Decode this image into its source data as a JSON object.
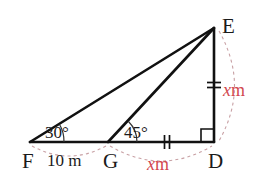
{
  "figure": {
    "background_color": "#ffffff",
    "stroke_color": "#111111",
    "accent_color": "#d2484f",
    "arc_color": "#c8a0a4",
    "width": 271,
    "height": 187
  },
  "vertices": {
    "E": {
      "label": "E",
      "x": 214,
      "y": 28,
      "label_x": 222,
      "label_y": 28
    },
    "F": {
      "label": "F",
      "x": 30,
      "y": 142,
      "label_x": 22,
      "label_y": 163
    },
    "G": {
      "label": "G",
      "x": 108,
      "y": 142,
      "label_x": 103,
      "label_y": 163
    },
    "D": {
      "label": "D",
      "x": 214,
      "y": 142,
      "label_x": 208,
      "label_y": 163
    }
  },
  "angles": [
    {
      "at": "F",
      "value": "30",
      "degree_symbol": "°",
      "label": "30°",
      "label_x": 45,
      "label_y": 134
    },
    {
      "at": "G",
      "value": "45",
      "degree_symbol": "°",
      "label": "45°",
      "label_x": 124,
      "label_y": 134
    },
    {
      "at": "D",
      "value": "90",
      "label": "right-angle",
      "marked": "square"
    }
  ],
  "segments": [
    {
      "name": "FE",
      "from": "F",
      "to": "E",
      "style": "solid"
    },
    {
      "name": "FD",
      "from": "F",
      "to": "D",
      "style": "solid"
    },
    {
      "name": "GE",
      "from": "G",
      "to": "E",
      "style": "solid"
    },
    {
      "name": "ED",
      "from": "E",
      "to": "D",
      "style": "solid"
    }
  ],
  "measures": [
    {
      "name": "FG",
      "text": "10 m",
      "value": "10",
      "unit": "m",
      "color": "#1a1a1a",
      "label_x": 47,
      "label_y": 162,
      "italic": false
    },
    {
      "name": "GD",
      "text_var": "x",
      "text_unit": "m",
      "text": "x m",
      "color": "#d2484f",
      "label_x": 147,
      "label_y": 166,
      "italic": true,
      "tick": "double-vertical"
    },
    {
      "name": "ED",
      "text_var": "x",
      "text_unit": "m",
      "text": "x m",
      "color": "#d2484f",
      "label_x": 223,
      "label_y": 92,
      "italic": true,
      "tick": "double-horizontal"
    }
  ],
  "tick_marks": [
    {
      "name": "gd-equal-tick",
      "on": "GD",
      "x": 167,
      "y": 142,
      "orientation": "vertical",
      "count": 2
    },
    {
      "name": "ed-equal-tick",
      "on": "ED",
      "x": 214,
      "y": 85,
      "orientation": "horizontal",
      "count": 2
    }
  ],
  "measure_arcs": [
    {
      "name": "fg-measure-arc",
      "from": "F",
      "to": "G",
      "bulge": "below"
    },
    {
      "name": "gd-measure-arc",
      "from": "G",
      "to": "D",
      "bulge": "below"
    },
    {
      "name": "ed-measure-arc",
      "from": "E",
      "to": "D",
      "bulge": "right"
    }
  ]
}
